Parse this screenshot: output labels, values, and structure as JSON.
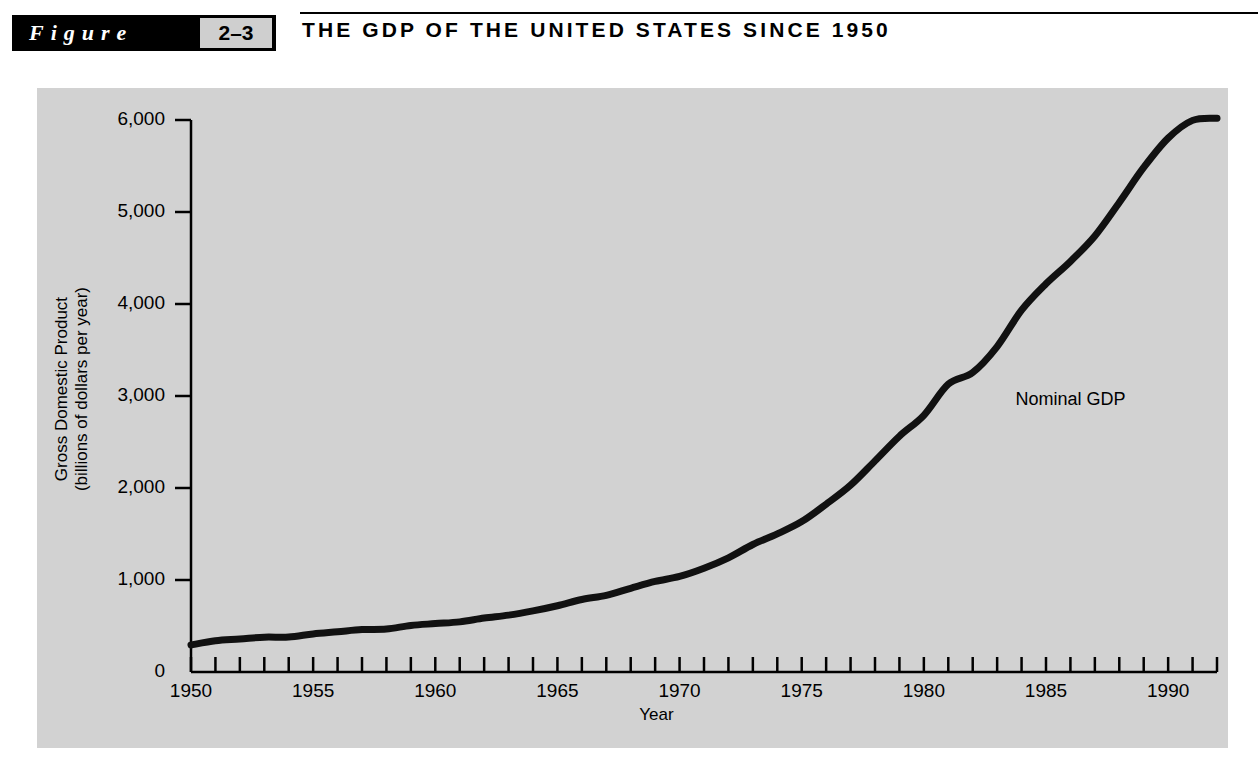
{
  "header": {
    "figure_word": "Figure",
    "figure_number": "2–3",
    "title": "THE GDP OF THE UNITED STATES SINCE 1950",
    "badge_bg": "#000000",
    "number_bg": "#cfcfcf"
  },
  "panel": {
    "background": "#d2d2d2",
    "line_color": "#111111",
    "axis_color": "#000000"
  },
  "chart_data": {
    "type": "line",
    "title": "THE GDP OF THE UNITED STATES SINCE 1950",
    "xlabel": "Year",
    "ylabel": "Gross Domestic Product (billions of dollars per year)",
    "ylabel_line1": "Gross Domestic Product",
    "ylabel_line2": "(billions of dollars per year)",
    "xlim": [
      1950,
      1992
    ],
    "ylim": [
      0,
      6000
    ],
    "grid": false,
    "legend_position": "inline-annotation",
    "y_ticks": [
      0,
      1000,
      2000,
      3000,
      4000,
      5000,
      6000
    ],
    "y_tick_labels": [
      "0",
      "1,000",
      "2,000",
      "3,000",
      "4,000",
      "5,000",
      "6,000"
    ],
    "x_ticks": [
      1950,
      1951,
      1952,
      1953,
      1954,
      1955,
      1956,
      1957,
      1958,
      1959,
      1960,
      1961,
      1962,
      1963,
      1964,
      1965,
      1966,
      1967,
      1968,
      1969,
      1970,
      1971,
      1972,
      1973,
      1974,
      1975,
      1976,
      1977,
      1978,
      1979,
      1980,
      1981,
      1982,
      1983,
      1984,
      1985,
      1986,
      1987,
      1988,
      1989,
      1990,
      1991,
      1992
    ],
    "x_tick_labels": [
      "1950",
      "1955",
      "1960",
      "1965",
      "1970",
      "1975",
      "1980",
      "1985",
      "1990"
    ],
    "x_labeled_ticks": [
      1950,
      1955,
      1960,
      1965,
      1970,
      1975,
      1980,
      1985,
      1990
    ],
    "series": [
      {
        "name": "Nominal GDP",
        "annotation": "Nominal GDP",
        "annotation_x": 1986,
        "annotation_y": 2950,
        "x": [
          1950,
          1951,
          1952,
          1953,
          1954,
          1955,
          1956,
          1957,
          1958,
          1959,
          1960,
          1961,
          1962,
          1963,
          1964,
          1965,
          1966,
          1967,
          1968,
          1969,
          1970,
          1971,
          1972,
          1973,
          1974,
          1975,
          1976,
          1977,
          1978,
          1979,
          1980,
          1981,
          1982,
          1983,
          1984,
          1985,
          1986,
          1987,
          1988,
          1989,
          1990,
          1991,
          1992
        ],
        "values": [
          294,
          339,
          358,
          379,
          380,
          414,
          437,
          461,
          467,
          506,
          526,
          545,
          586,
          618,
          664,
          720,
          788,
          833,
          910,
          984,
          1039,
          1128,
          1241,
          1386,
          1501,
          1635,
          1824,
          2031,
          2295,
          2563,
          2790,
          3128,
          3255,
          3537,
          3933,
          4220,
          4463,
          4740,
          5104,
          5484,
          5803,
          5996,
          6020
        ]
      }
    ]
  }
}
